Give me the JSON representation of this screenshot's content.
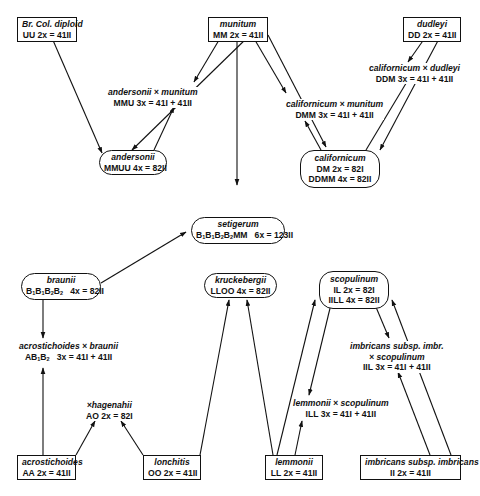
{
  "nodes": {
    "br_col_diploid": {
      "name": "Br. Col. diploid",
      "lines": [
        "UU   2x = 41II"
      ]
    },
    "munitum": {
      "name": "munitum",
      "lines": [
        "MM   2x = 41II"
      ]
    },
    "dudleyi": {
      "name": "dudleyi",
      "lines": [
        "DD   2x = 41II"
      ]
    },
    "andersonii": {
      "name": "andersonii",
      "lines": [
        "MMUU   4x = 82II"
      ]
    },
    "californicum": {
      "name": "californicum",
      "lines": [
        "DM   2x = 82I",
        "DDMM   4x = 82II"
      ]
    },
    "setigerum": {
      "name": "setigerum",
      "lines": [
        "B1B1B2B2MM   6x = 123II"
      ]
    },
    "braunii": {
      "name": "braunii",
      "lines": [
        "B1B1B2B2   4x = 82II"
      ]
    },
    "kruckebergii": {
      "name": "kruckebergii",
      "lines": [
        "LLOO   4x = 82II"
      ]
    },
    "scopulinum": {
      "name": "scopulinum",
      "lines": [
        "IL   2x = 82I",
        "IILL   4x = 82II"
      ]
    },
    "acrostichoides": {
      "name": "acrostichoides",
      "lines": [
        "AA   2x = 41II"
      ]
    },
    "lonchitis": {
      "name": "lonchitis",
      "lines": [
        "OO   2x = 41II"
      ]
    },
    "lemmonii": {
      "name": "lemmonii",
      "lines": [
        "LL   2x = 41II"
      ]
    },
    "imbricans_imbricans": {
      "name": "imbricans subsp. imbricans",
      "lines": [
        "II   2x = 41II"
      ]
    }
  },
  "hybrids": {
    "andersonii_x_munitum": {
      "name": "andersonii × munitum",
      "lines": [
        "MMU   3x = 41I + 41II"
      ]
    },
    "californicum_x_dudleyi": {
      "name": "californicum × dudleyi",
      "lines": [
        "DDM   3x = 41I + 41II"
      ]
    },
    "californicum_x_munitum": {
      "name": "californicum × munitum",
      "lines": [
        "DMM   3x = 41I + 41II"
      ]
    },
    "acrostichoides_x_braunii": {
      "name": "acrostichoides × braunii",
      "lines": [
        "AB1B2   3x = 41I + 41II"
      ]
    },
    "x_hagenahii": {
      "name": "×hagenahii",
      "lines": [
        "AO   2x = 82I"
      ]
    },
    "imbricans_x_scopulinum": {
      "name": "imbricans subsp. imbr.",
      "name2": "× scopulinum",
      "lines": [
        "IIL   3x = 41I + 41II"
      ]
    },
    "lemmonii_x_scopulinum": {
      "name": "lemmonii × scopulinum",
      "lines": [
        "ILL   3x = 41I + 41II"
      ]
    }
  },
  "colors": {
    "line": "#111111",
    "background": "#ffffff"
  }
}
